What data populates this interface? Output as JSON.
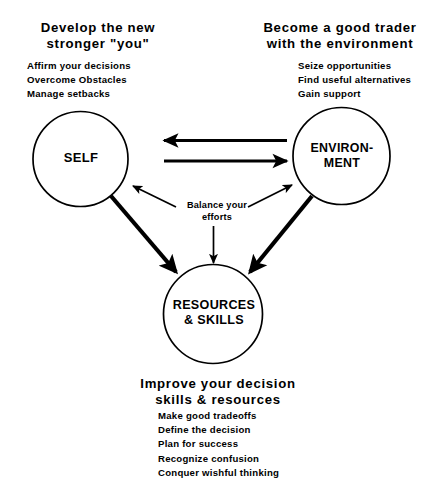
{
  "diagram": {
    "colors": {
      "stroke": "#000000",
      "background": "#ffffff"
    },
    "nodes": {
      "self": {
        "label_line1": "SELF",
        "heading_line1": "Develop the new",
        "heading_line2": "stronger \"you\"",
        "bullets": [
          "Affirm your decisions",
          "Overcome Obstacles",
          "Manage setbacks"
        ]
      },
      "environment": {
        "label_line1": "ENVIRON-",
        "label_line2": "MENT",
        "heading_line1": "Become a good trader",
        "heading_line2": "with the environment",
        "bullets": [
          "Seize opportunities",
          "Find useful alternatives",
          "Gain support"
        ]
      },
      "resources": {
        "label_line1": "RESOURCES",
        "label_line2": "& SKILLS",
        "heading_line1": "Improve your decision",
        "heading_line2": "skills & resources",
        "bullets": [
          "Make good tradeoffs",
          "Define the decision",
          "Plan for success",
          "Recognize confusion",
          "Conquer wishful thinking"
        ]
      }
    },
    "center_note": {
      "line1": "Balance your",
      "line2": "efforts"
    }
  }
}
